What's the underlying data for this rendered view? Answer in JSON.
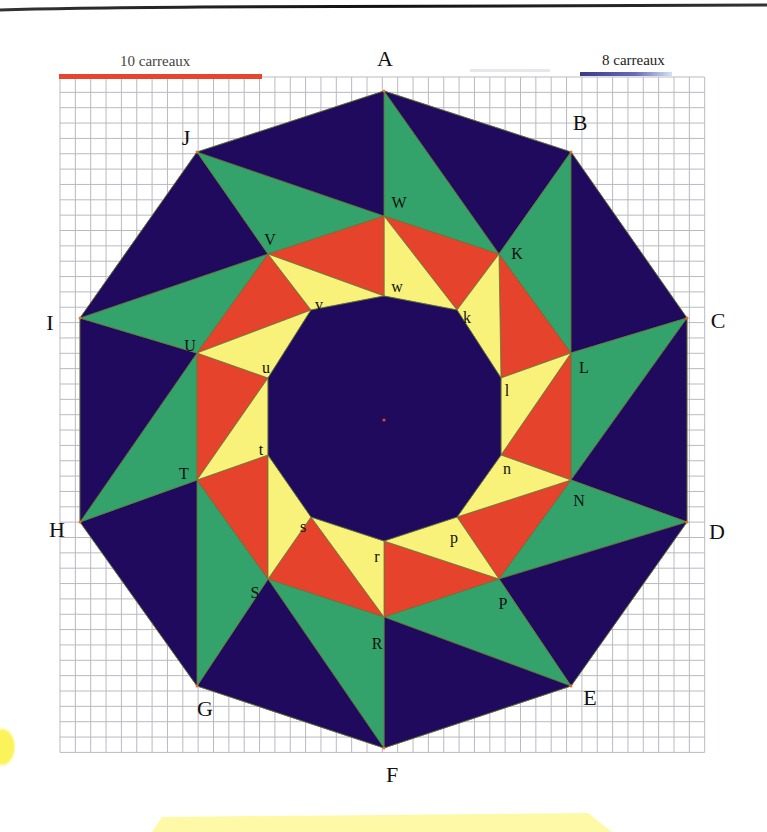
{
  "figure": {
    "type": "geometric-construction"
  },
  "colors": {
    "navy": "#1f0a5e",
    "green": "#33a36b",
    "red": "#e5432c",
    "yellow": "#f8f27a",
    "grid": "#b9b9c4",
    "scale_red": "#e8452f",
    "scale_blue": "#3a3a8a",
    "highlight_yellow": "#fdf9a6",
    "edge": "#6b7a3a"
  },
  "scales": [
    {
      "label": "10 carreaux",
      "cells": 10,
      "color": "red"
    },
    {
      "label": "8 carreaux",
      "cells": 8,
      "color": "blue"
    }
  ],
  "grid": {
    "x0": 60,
    "y0": 77,
    "cols": 42,
    "rows": 44,
    "cell": 15.35
  },
  "center": {
    "x": 384,
    "y": 420
  },
  "outer_vertices": [
    {
      "name": "A",
      "x": 384,
      "y": 91,
      "lx": 385,
      "ly": 59
    },
    {
      "name": "B",
      "x": 571,
      "y": 152,
      "lx": 580,
      "ly": 123
    },
    {
      "name": "C",
      "x": 687,
      "y": 318,
      "lx": 718,
      "ly": 321
    },
    {
      "name": "D",
      "x": 687,
      "y": 522,
      "lx": 717,
      "ly": 532
    },
    {
      "name": "E",
      "x": 571,
      "y": 686,
      "lx": 590,
      "ly": 698
    },
    {
      "name": "F",
      "x": 384,
      "y": 748,
      "lx": 392,
      "ly": 775
    },
    {
      "name": "G",
      "x": 197,
      "y": 686,
      "lx": 205,
      "ly": 709
    },
    {
      "name": "H",
      "x": 80,
      "y": 522,
      "lx": 57,
      "ly": 530
    },
    {
      "name": "I",
      "x": 80,
      "y": 318,
      "lx": 50,
      "ly": 323
    },
    {
      "name": "J",
      "x": 197,
      "y": 152,
      "lx": 186,
      "ly": 138
    }
  ],
  "middle_vertices": [
    {
      "name": "W",
      "x": 384,
      "y": 216,
      "lx": 399,
      "ly": 203
    },
    {
      "name": "K",
      "x": 499,
      "y": 254,
      "lx": 517,
      "ly": 254
    },
    {
      "name": "L",
      "x": 571,
      "y": 353,
      "lx": 584,
      "ly": 368
    },
    {
      "name": "N",
      "x": 571,
      "y": 480,
      "lx": 579,
      "ly": 501
    },
    {
      "name": "P",
      "x": 499,
      "y": 579,
      "lx": 503,
      "ly": 604
    },
    {
      "name": "R",
      "x": 384,
      "y": 617,
      "lx": 377,
      "ly": 644
    },
    {
      "name": "S",
      "x": 268,
      "y": 579,
      "lx": 255,
      "ly": 593
    },
    {
      "name": "T",
      "x": 197,
      "y": 480,
      "lx": 184,
      "ly": 474
    },
    {
      "name": "U",
      "x": 197,
      "y": 353,
      "lx": 190,
      "ly": 346
    },
    {
      "name": "V",
      "x": 268,
      "y": 254,
      "lx": 270,
      "ly": 240
    }
  ],
  "inner_vertices": [
    {
      "name": "w",
      "x": 384,
      "y": 296,
      "lx": 397,
      "ly": 287
    },
    {
      "name": "k",
      "x": 457,
      "y": 310,
      "lx": 467,
      "ly": 318
    },
    {
      "name": "l",
      "x": 501,
      "y": 378,
      "lx": 507,
      "ly": 391
    },
    {
      "name": "n",
      "x": 501,
      "y": 455,
      "lx": 507,
      "ly": 469
    },
    {
      "name": "p",
      "x": 457,
      "y": 517,
      "lx": 454,
      "ly": 538
    },
    {
      "name": "r",
      "x": 384,
      "y": 541,
      "lx": 377,
      "ly": 557
    },
    {
      "name": "s",
      "x": 311,
      "y": 517,
      "lx": 303,
      "ly": 527
    },
    {
      "name": "t",
      "x": 268,
      "y": 455,
      "lx": 261,
      "ly": 450
    },
    {
      "name": "u",
      "x": 268,
      "y": 378,
      "lx": 266,
      "ly": 368
    },
    {
      "name": "v",
      "x": 311,
      "y": 310,
      "lx": 319,
      "ly": 305
    }
  ]
}
